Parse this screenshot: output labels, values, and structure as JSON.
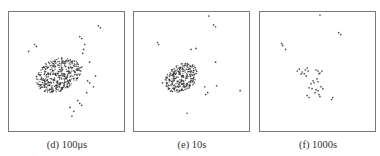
{
  "figure": {
    "panels": [
      {
        "id": "d",
        "caption": "(d) 100μs",
        "description": "Dense irregular cluster of particles left-of-center with scattered outliers",
        "cluster": {
          "cx": 50,
          "cy": 64,
          "rx": 22,
          "ry": 18,
          "count": 420,
          "seed": 11
        },
        "outliers": [
          [
            91,
            14
          ],
          [
            93,
            16
          ],
          [
            72,
            25
          ],
          [
            74,
            27
          ],
          [
            26,
            33
          ],
          [
            28,
            35
          ],
          [
            20,
            40
          ],
          [
            77,
            33
          ],
          [
            76,
            38
          ],
          [
            75,
            42
          ],
          [
            82,
            51
          ],
          [
            74,
            56
          ],
          [
            73,
            60
          ],
          [
            88,
            65
          ],
          [
            80,
            70
          ],
          [
            82,
            72
          ],
          [
            86,
            76
          ],
          [
            79,
            82
          ],
          [
            70,
            90
          ],
          [
            72,
            93
          ],
          [
            74,
            95
          ],
          [
            62,
            97
          ],
          [
            66,
            101
          ],
          [
            64,
            106
          ]
        ]
      },
      {
        "id": "e",
        "caption": "(e) 10s",
        "description": "Smaller compact cluster with sparse outliers",
        "cluster": {
          "cx": 48,
          "cy": 67,
          "rx": 16,
          "ry": 15,
          "count": 300,
          "seed": 23
        },
        "outliers": [
          [
            76,
            4
          ],
          [
            81,
            13
          ],
          [
            83,
            15
          ],
          [
            24,
            31
          ],
          [
            25,
            33
          ],
          [
            58,
            38
          ],
          [
            63,
            37
          ],
          [
            83,
            51
          ],
          [
            29,
            72
          ],
          [
            72,
            76
          ],
          [
            84,
            75
          ],
          [
            108,
            80
          ],
          [
            75,
            82
          ],
          [
            73,
            84
          ],
          [
            54,
            103
          ]
        ]
      },
      {
        "id": "f",
        "caption": "(f) 1000s",
        "description": "Dispersed small groups of particles",
        "cluster": {
          "cx": 54,
          "cy": 68,
          "rx": 14,
          "ry": 13,
          "count": 0,
          "seed": 37
        },
        "outliers": [
          [
            61,
            3
          ],
          [
            80,
            21
          ],
          [
            82,
            23
          ],
          [
            22,
            32
          ],
          [
            23,
            34
          ],
          [
            26,
            38
          ],
          [
            38,
            60
          ],
          [
            40,
            58
          ],
          [
            43,
            61
          ],
          [
            45,
            63
          ],
          [
            46,
            59
          ],
          [
            48,
            57
          ],
          [
            49,
            60
          ],
          [
            42,
            63
          ],
          [
            47,
            65
          ],
          [
            57,
            59
          ],
          [
            59,
            60
          ],
          [
            61,
            62
          ],
          [
            63,
            60
          ],
          [
            60,
            63
          ],
          [
            54,
            70
          ],
          [
            55,
            72
          ],
          [
            52,
            73
          ],
          [
            58,
            68
          ],
          [
            59,
            71
          ],
          [
            50,
            77
          ],
          [
            53,
            78
          ],
          [
            57,
            79
          ],
          [
            56,
            82
          ],
          [
            59,
            80
          ],
          [
            62,
            76
          ],
          [
            64,
            78
          ],
          [
            48,
            85
          ],
          [
            50,
            87
          ],
          [
            60,
            84
          ],
          [
            61,
            86
          ],
          [
            74,
            87
          ],
          [
            73,
            89
          ]
        ]
      }
    ],
    "point_color": "#2a2a2a",
    "border_color": "#7a7a7a"
  }
}
